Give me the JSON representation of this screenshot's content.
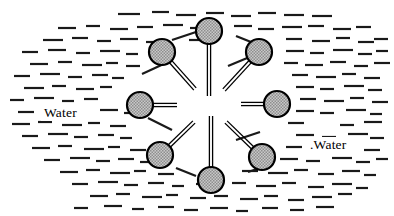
{
  "figure": {
    "background_color": "#ffffff",
    "width": 394,
    "height": 216
  },
  "labels": [
    {
      "name": "water-label-left",
      "text": "Water",
      "x": 44,
      "y": 117
    },
    {
      "name": "water-label-right",
      "text": ".Water",
      "x": 310,
      "y": 149
    }
  ],
  "micelle": {
    "head_fill_color": "#b9b9b9",
    "head_stroke_color": "#000000",
    "head_stroke_width": 2.2,
    "head_radius": 13,
    "tail_color": "#000000",
    "tail_stroke_width": 1.3,
    "tail_gap": 3.2,
    "core_center": {
      "x": 209,
      "y": 105
    },
    "core_radius": 30,
    "molecule_count": 8,
    "molecules": [
      {
        "name": "surfactant-top",
        "angle_deg": -90,
        "head_x": 209,
        "head_y": 31,
        "tail_inner_x": 209,
        "tail_inner_y": 96
      },
      {
        "name": "surfactant-upper-right",
        "angle_deg": -45,
        "head_x": 259,
        "head_y": 52,
        "tail_inner_x": 224,
        "tail_inner_y": 90
      },
      {
        "name": "surfactant-right",
        "angle_deg": 0,
        "head_x": 277,
        "head_y": 104,
        "tail_inner_x": 241,
        "tail_inner_y": 104
      },
      {
        "name": "surfactant-lower-right",
        "angle_deg": 45,
        "head_x": 262,
        "head_y": 157,
        "tail_inner_x": 226,
        "tail_inner_y": 122
      },
      {
        "name": "surfactant-bottom",
        "angle_deg": 90,
        "head_x": 211,
        "head_y": 180,
        "tail_inner_x": 211,
        "tail_inner_y": 116
      },
      {
        "name": "surfactant-lower-left",
        "angle_deg": 135,
        "head_x": 160,
        "head_y": 155,
        "tail_inner_x": 194,
        "tail_inner_y": 122
      },
      {
        "name": "surfactant-left",
        "angle_deg": 180,
        "head_x": 140,
        "head_y": 105,
        "tail_inner_x": 177,
        "tail_inner_y": 105
      },
      {
        "name": "surfactant-upper-left",
        "angle_deg": -135,
        "head_x": 162,
        "head_y": 52,
        "tail_inner_x": 195,
        "tail_inner_y": 89
      }
    ]
  },
  "water_field": {
    "dash_color": "#1a1a1a",
    "dash_thickness": 2.2,
    "dash_length_min": 10,
    "dash_length_max": 22,
    "description": "Irregular field of short horizontal dashes representing bulk water, forming a lens-shaped region around the micelle",
    "dashes": [
      [
        118,
        14,
        22
      ],
      [
        152,
        12,
        17
      ],
      [
        176,
        15,
        20
      ],
      [
        206,
        13,
        18
      ],
      [
        231,
        16,
        20
      ],
      [
        258,
        13,
        18
      ],
      [
        284,
        15,
        20
      ],
      [
        312,
        16,
        20
      ],
      [
        58,
        28,
        18
      ],
      [
        86,
        26,
        14
      ],
      [
        110,
        29,
        18
      ],
      [
        137,
        27,
        16
      ],
      [
        163,
        25,
        20
      ],
      [
        190,
        28,
        16
      ],
      [
        234,
        26,
        18
      ],
      [
        258,
        29,
        16
      ],
      [
        282,
        27,
        20
      ],
      [
        308,
        26,
        16
      ],
      [
        333,
        29,
        18
      ],
      [
        356,
        27,
        15
      ],
      [
        43,
        40,
        20
      ],
      [
        72,
        38,
        16
      ],
      [
        97,
        41,
        14
      ],
      [
        120,
        39,
        18
      ],
      [
        146,
        42,
        13
      ],
      [
        189,
        40,
        14
      ],
      [
        286,
        39,
        16
      ],
      [
        312,
        41,
        18
      ],
      [
        336,
        38,
        14
      ],
      [
        358,
        42,
        16
      ],
      [
        374,
        39,
        14
      ],
      [
        22,
        52,
        16
      ],
      [
        48,
        50,
        18
      ],
      [
        76,
        53,
        14
      ],
      [
        100,
        51,
        20
      ],
      [
        126,
        54,
        12
      ],
      [
        286,
        51,
        18
      ],
      [
        310,
        53,
        14
      ],
      [
        333,
        50,
        20
      ],
      [
        358,
        54,
        14
      ],
      [
        376,
        51,
        12
      ],
      [
        30,
        64,
        18
      ],
      [
        58,
        62,
        14
      ],
      [
        82,
        65,
        20
      ],
      [
        106,
        63,
        12
      ],
      [
        126,
        66,
        14
      ],
      [
        284,
        63,
        14
      ],
      [
        305,
        65,
        18
      ],
      [
        330,
        62,
        16
      ],
      [
        354,
        66,
        14
      ],
      [
        374,
        63,
        16
      ],
      [
        14,
        76,
        16
      ],
      [
        40,
        74,
        20
      ],
      [
        68,
        77,
        14
      ],
      [
        92,
        75,
        16
      ],
      [
        112,
        78,
        12
      ],
      [
        292,
        75,
        16
      ],
      [
        316,
        77,
        20
      ],
      [
        342,
        74,
        14
      ],
      [
        364,
        78,
        16
      ],
      [
        24,
        88,
        20
      ],
      [
        52,
        86,
        14
      ],
      [
        76,
        89,
        18
      ],
      [
        100,
        87,
        12
      ],
      [
        296,
        87,
        18
      ],
      [
        320,
        89,
        14
      ],
      [
        344,
        86,
        20
      ],
      [
        368,
        90,
        14
      ],
      [
        10,
        100,
        14
      ],
      [
        34,
        98,
        20
      ],
      [
        62,
        101,
        12
      ],
      [
        84,
        99,
        14
      ],
      [
        300,
        99,
        16
      ],
      [
        324,
        101,
        20
      ],
      [
        350,
        98,
        14
      ],
      [
        372,
        102,
        16
      ],
      [
        18,
        112,
        16
      ],
      [
        100,
        110,
        18
      ],
      [
        124,
        113,
        13
      ],
      [
        296,
        111,
        18
      ],
      [
        320,
        113,
        14
      ],
      [
        346,
        110,
        20
      ],
      [
        370,
        114,
        12
      ],
      [
        12,
        124,
        18
      ],
      [
        38,
        122,
        14
      ],
      [
        62,
        125,
        20
      ],
      [
        88,
        123,
        12
      ],
      [
        110,
        126,
        16
      ],
      [
        288,
        123,
        16
      ],
      [
        340,
        125,
        14
      ],
      [
        364,
        122,
        18
      ],
      [
        22,
        136,
        16
      ],
      [
        48,
        134,
        20
      ],
      [
        74,
        137,
        14
      ],
      [
        98,
        135,
        16
      ],
      [
        120,
        138,
        12
      ],
      [
        296,
        135,
        18
      ],
      [
        322,
        137,
        14
      ],
      [
        348,
        134,
        20
      ],
      [
        370,
        138,
        14
      ],
      [
        32,
        148,
        18
      ],
      [
        58,
        146,
        14
      ],
      [
        84,
        149,
        20
      ],
      [
        108,
        147,
        12
      ],
      [
        130,
        150,
        16
      ],
      [
        286,
        147,
        16
      ],
      [
        314,
        149,
        20
      ],
      [
        340,
        146,
        14
      ],
      [
        364,
        150,
        16
      ],
      [
        44,
        160,
        16
      ],
      [
        70,
        158,
        20
      ],
      [
        96,
        161,
        14
      ],
      [
        118,
        159,
        16
      ],
      [
        140,
        162,
        12
      ],
      [
        280,
        159,
        18
      ],
      [
        306,
        161,
        14
      ],
      [
        332,
        158,
        20
      ],
      [
        356,
        162,
        14
      ],
      [
        376,
        159,
        12
      ],
      [
        60,
        172,
        18
      ],
      [
        86,
        170,
        14
      ],
      [
        110,
        173,
        20
      ],
      [
        134,
        171,
        12
      ],
      [
        158,
        174,
        16
      ],
      [
        242,
        171,
        16
      ],
      [
        268,
        173,
        20
      ],
      [
        294,
        170,
        14
      ],
      [
        318,
        174,
        16
      ],
      [
        342,
        171,
        18
      ],
      [
        364,
        175,
        12
      ],
      [
        72,
        184,
        16
      ],
      [
        98,
        182,
        20
      ],
      [
        124,
        185,
        14
      ],
      [
        148,
        183,
        16
      ],
      [
        172,
        186,
        12
      ],
      [
        196,
        184,
        18
      ],
      [
        232,
        183,
        14
      ],
      [
        256,
        186,
        20
      ],
      [
        282,
        183,
        14
      ],
      [
        308,
        187,
        16
      ],
      [
        332,
        184,
        20
      ],
      [
        356,
        188,
        12
      ],
      [
        90,
        196,
        18
      ],
      [
        116,
        194,
        14
      ],
      [
        142,
        197,
        20
      ],
      [
        166,
        195,
        12
      ],
      [
        190,
        198,
        16
      ],
      [
        214,
        196,
        14
      ],
      [
        240,
        199,
        18
      ],
      [
        264,
        196,
        14
      ],
      [
        288,
        200,
        16
      ],
      [
        312,
        197,
        20
      ],
      [
        338,
        194,
        14
      ],
      [
        74,
        208,
        14
      ],
      [
        104,
        206,
        18
      ],
      [
        132,
        209,
        12
      ],
      [
        158,
        207,
        16
      ],
      [
        184,
        210,
        14
      ],
      [
        210,
        208,
        18
      ],
      [
        236,
        211,
        12
      ],
      [
        262,
        208,
        16
      ],
      [
        290,
        210,
        14
      ],
      [
        316,
        207,
        18
      ]
    ],
    "angled_dashes": [
      [
        142,
        74,
        168,
        62
      ],
      [
        148,
        118,
        172,
        130
      ],
      [
        228,
        66,
        252,
        56
      ],
      [
        236,
        140,
        260,
        132
      ],
      [
        172,
        40,
        196,
        32
      ],
      [
        236,
        36,
        256,
        44
      ],
      [
        176,
        168,
        196,
        176
      ],
      [
        248,
        172,
        272,
        164
      ]
    ]
  }
}
